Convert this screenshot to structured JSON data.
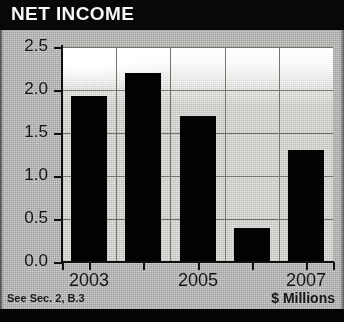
{
  "header": {
    "title": "NET INCOME"
  },
  "footer": {
    "source_note": "See Sec. 2, B.3",
    "units_note": "$ Millions"
  },
  "chart_data": {
    "type": "bar",
    "title": "NET INCOME",
    "xlabel": "",
    "ylabel": "",
    "units": "$ Millions",
    "categories": [
      "2003",
      "2004",
      "2005",
      "2006",
      "2007"
    ],
    "values": [
      1.93,
      2.2,
      1.7,
      0.4,
      1.3
    ],
    "tick_labels_x": [
      "2003",
      "",
      "2005",
      "",
      "2007"
    ],
    "ylim": [
      0.0,
      2.5
    ],
    "yticks": [
      0.0,
      0.5,
      1.0,
      1.5,
      2.0,
      2.5
    ],
    "ytick_labels": [
      "0.0",
      "0.5",
      "1.0",
      "1.5",
      "2.0",
      "2.5"
    ],
    "grid": true,
    "legend": false,
    "bar_color": "#070707",
    "plot_background": "#cfcecb",
    "header_background": "#0d0d0d",
    "header_text_color": "#f2f2f2"
  }
}
